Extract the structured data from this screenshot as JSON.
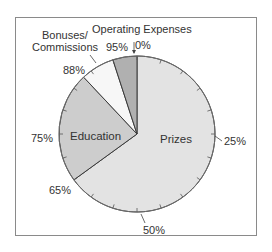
{
  "chart_data": {
    "type": "pie",
    "title": "",
    "start_angle_deg": 0,
    "direction": "clockwise",
    "slices": [
      {
        "label": "Prizes",
        "start_pct": 0,
        "end_pct": 65,
        "value": 65,
        "color": "#e3e3e3"
      },
      {
        "label": "Education",
        "start_pct": 65,
        "end_pct": 88,
        "value": 23,
        "color": "#cdcdcd"
      },
      {
        "label": "Bonuses/ Commissions",
        "start_pct": 88,
        "end_pct": 95,
        "value": 7,
        "color": "#f7f7f7"
      },
      {
        "label": "Operating Expenses",
        "start_pct": 95,
        "end_pct": 100,
        "value": 5,
        "color": "#b0b0b0"
      }
    ],
    "percent_markers": [
      "0%",
      "25%",
      "50%",
      "65%",
      "75%",
      "88%",
      "95%"
    ],
    "tick_interval_pct": 5
  },
  "labels": {
    "prizes": "Prizes",
    "education": "Education",
    "bonuses_line1": "Bonuses/",
    "bonuses_line2": "Commissions",
    "operating": "Operating Expenses",
    "p0": "0%",
    "p25": "25%",
    "p50": "50%",
    "p65": "65%",
    "p75": "75%",
    "p88": "88%",
    "p95": "95%"
  }
}
